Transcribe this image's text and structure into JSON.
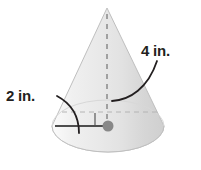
{
  "figure": {
    "name": "cone-diagram",
    "shape": "cone",
    "background_color": "#ffffff",
    "labels": {
      "height_label": "4 in.",
      "radius_label": "2 in."
    },
    "measurements": [
      {
        "name": "height",
        "value": 4,
        "unit": "in.",
        "text": "4 in.",
        "refers_to": "cone-axis-height"
      },
      {
        "name": "radius",
        "value": 2,
        "unit": "in.",
        "text": "2 in.",
        "refers_to": "cone-base-radius"
      }
    ],
    "colors": {
      "cone_fill_light": "#f2f2f2",
      "cone_fill_mid": "#e4e4e4",
      "cone_fill_dark": "#d2d2d2",
      "outline": "#bcbcbc",
      "label_text": "#231f20",
      "leader_line": "#231f20",
      "center_dot": "#808080",
      "dashed_axis": "#9a9a9a",
      "radius_line": "#4d4d4d"
    },
    "elements": [
      "cone-body",
      "cone-base-ellipse",
      "dashed-vertical-axis",
      "dashed-horizontal-diameter",
      "right-angle-marker",
      "center-dot",
      "radius-segment",
      "height-leader-curve",
      "radius-leader-curve"
    ]
  }
}
